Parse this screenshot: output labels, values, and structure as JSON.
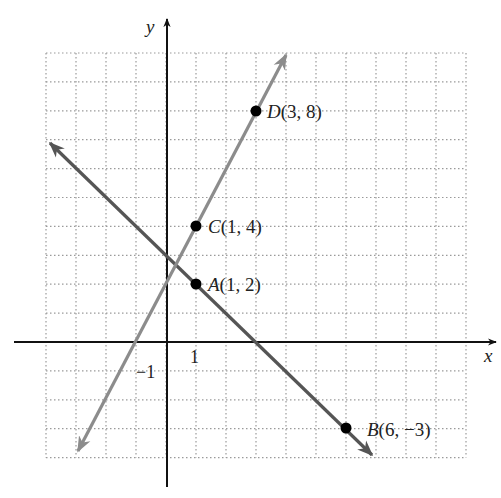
{
  "chart_data": {
    "type": "line",
    "title": "",
    "xlabel": "x",
    "ylabel": "y",
    "xlim": [
      -4,
      10
    ],
    "ylim": [
      -4,
      10
    ],
    "grid": true,
    "tick_labels": {
      "x": [
        "1"
      ],
      "y": [
        "-1"
      ]
    },
    "tick_labels_display": {
      "x_one": "1",
      "y_minus_one": "−1"
    },
    "points": [
      {
        "name": "A",
        "x": 1,
        "y": 2,
        "label": "A(1, 2)",
        "letter": "A",
        "coords": "(1, 2)"
      },
      {
        "name": "B",
        "x": 6,
        "y": -3,
        "label": "B(6, −3)",
        "letter": "B",
        "coords": "(6, −3)"
      },
      {
        "name": "C",
        "x": 1,
        "y": 4,
        "label": "C(1, 4)",
        "letter": "C",
        "coords": "(1, 4)"
      },
      {
        "name": "D",
        "x": 3,
        "y": 8,
        "label": "D(3, 8)",
        "letter": "D",
        "coords": "(3, 8)"
      }
    ],
    "series": [
      {
        "name": "line AB",
        "through": [
          "A",
          "B"
        ],
        "equation": "y = -x + 3",
        "color": "#555555",
        "x": [
          -4,
          6.9
        ],
        "y": [
          7,
          -3.9
        ]
      },
      {
        "name": "line CD",
        "through": [
          "C",
          "D"
        ],
        "equation": "y = 2x + 2",
        "color": "#8c8c8c",
        "x": [
          -2.97,
          4.05
        ],
        "y": [
          -3.9,
          10.1
        ]
      }
    ]
  },
  "colors": {
    "axis": "#111111",
    "grid": "#9a9a9a",
    "line_ab": "#555555",
    "line_cd": "#8c8c8c",
    "point": "#000000"
  }
}
